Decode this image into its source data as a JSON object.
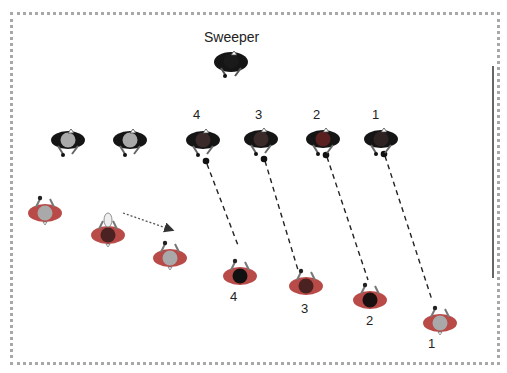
{
  "title_label": "Sweeper",
  "top_row_labels": [
    "4",
    "3",
    "2",
    "1"
  ],
  "bottom_row_labels": [
    "4",
    "3",
    "2",
    "1"
  ],
  "colors": {
    "border": "#a8a8a8",
    "dark_body": "#151515",
    "red_body": "#c8413f",
    "gray_head": "#a9a9a9",
    "dashed_line": "#222222",
    "dotted_arrow": "#555555"
  },
  "figures": {
    "sweeper": {
      "x": 231,
      "y": 62,
      "body": "dark",
      "head": "dark",
      "facing": "down"
    },
    "top_row": [
      {
        "id": "wait-a",
        "x": 68,
        "y": 140,
        "body": "dark",
        "head": "gray",
        "facing": "down"
      },
      {
        "id": "wait-b",
        "x": 130,
        "y": 140,
        "body": "dark",
        "head": "gray",
        "facing": "down"
      },
      {
        "id": "4",
        "x": 203,
        "y": 140,
        "body": "dark",
        "head": "darkred",
        "facing": "down"
      },
      {
        "id": "3",
        "x": 261,
        "y": 139,
        "body": "dark",
        "head": "darkred",
        "facing": "down"
      },
      {
        "id": "2",
        "x": 323,
        "y": 139,
        "body": "dark",
        "head": "red",
        "facing": "down"
      },
      {
        "id": "1",
        "x": 381,
        "y": 139,
        "body": "dark",
        "head": "darkred",
        "facing": "down"
      }
    ],
    "bottom_row": [
      {
        "id": "left-a",
        "x": 45,
        "y": 211,
        "body": "red",
        "head": "gray",
        "facing": "up"
      },
      {
        "id": "left-b",
        "x": 108,
        "y": 232,
        "body": "red",
        "head": "darkred",
        "facing": "up"
      },
      {
        "id": "left-c",
        "x": 170,
        "y": 256,
        "body": "red",
        "head": "gray",
        "facing": "up"
      },
      {
        "id": "4",
        "x": 240,
        "y": 276,
        "body": "red",
        "head": "black",
        "facing": "up"
      },
      {
        "id": "3",
        "x": 306,
        "y": 286,
        "body": "red",
        "head": "darkred",
        "facing": "up"
      },
      {
        "id": "2",
        "x": 370,
        "y": 300,
        "body": "red",
        "head": "black",
        "facing": "up"
      },
      {
        "id": "1",
        "x": 440,
        "y": 323,
        "body": "red",
        "head": "gray",
        "facing": "up"
      }
    ]
  }
}
